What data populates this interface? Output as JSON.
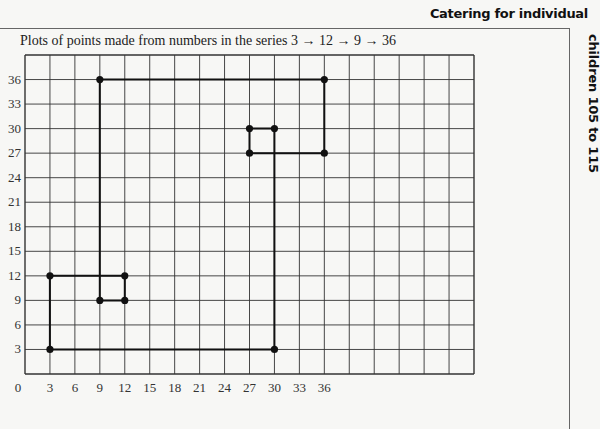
{
  "header": {
    "title": "Catering for individual",
    "side_title": "children 105 to 115"
  },
  "caption": "Plots of points made from numbers in the series 3 → 12 → 9 → 36",
  "chart_data": {
    "type": "line",
    "title": "Plots of points made from numbers in the series 3 → 12 → 9 → 36",
    "xlabel": "",
    "ylabel": "",
    "grid": true,
    "xlim": [
      0,
      54
    ],
    "ylim": [
      0,
      39
    ],
    "x_ticks": [
      0,
      3,
      6,
      9,
      12,
      15,
      18,
      21,
      24,
      27,
      30,
      33,
      36
    ],
    "y_ticks": [
      3,
      6,
      9,
      12,
      15,
      18,
      21,
      24,
      27,
      30,
      33,
      36
    ],
    "series": [
      {
        "name": "path",
        "closed": true,
        "points": [
          [
            3,
            3
          ],
          [
            3,
            12
          ],
          [
            12,
            12
          ],
          [
            12,
            9
          ],
          [
            9,
            9
          ],
          [
            9,
            36
          ],
          [
            36,
            36
          ],
          [
            36,
            27
          ],
          [
            27,
            27
          ],
          [
            27,
            30
          ],
          [
            30,
            30
          ],
          [
            30,
            3
          ],
          [
            3,
            3
          ]
        ]
      }
    ],
    "markers": [
      [
        3,
        3
      ],
      [
        3,
        12
      ],
      [
        12,
        12
      ],
      [
        12,
        9
      ],
      [
        9,
        9
      ],
      [
        9,
        36
      ],
      [
        36,
        36
      ],
      [
        36,
        27
      ],
      [
        27,
        27
      ],
      [
        27,
        30
      ],
      [
        30,
        30
      ],
      [
        30,
        3
      ]
    ]
  }
}
